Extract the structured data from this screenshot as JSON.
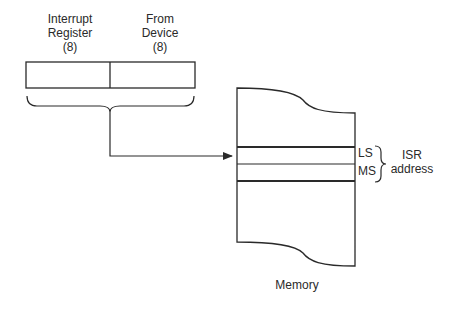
{
  "register": {
    "fields": [
      {
        "line1": "Interrupt",
        "line2": "Register",
        "line3": "(8)"
      },
      {
        "line1": "From",
        "line2": "Device",
        "line3": "(8)"
      }
    ]
  },
  "memory": {
    "label": "Memory",
    "entries": [
      {
        "label": "LS"
      },
      {
        "label": "MS"
      }
    ],
    "group_label_line1": "ISR",
    "group_label_line2": "address"
  },
  "colors": {
    "stroke": "#2a2a2a",
    "background": "#ffffff"
  }
}
